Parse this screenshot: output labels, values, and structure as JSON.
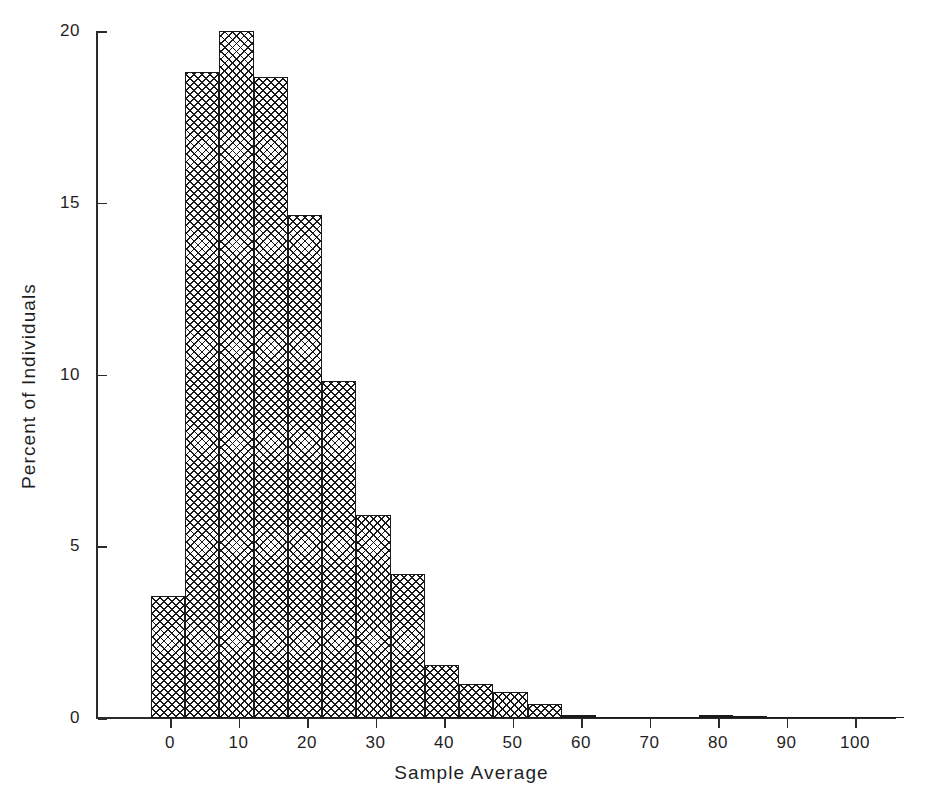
{
  "chart_data": {
    "type": "bar",
    "title": "",
    "subtitle": "",
    "xlabel": "Sample Average",
    "ylabel": "Percent of Individuals",
    "xlim": [
      -7,
      110
    ],
    "ylim": [
      0,
      20
    ],
    "grid": false,
    "legend": null,
    "bin_width": 5,
    "bin_starts": [
      -2.8,
      2.2,
      7.2,
      12.2,
      17.2,
      22.2,
      27.2,
      32.2,
      37.2,
      42.2,
      47.2,
      52.2,
      57.2,
      62.2,
      67.2,
      72.2,
      77.2,
      82.2,
      87.2,
      92.2,
      97.2,
      102.2
    ],
    "bin_centers": [
      -0.3,
      4.7,
      9.7,
      14.7,
      19.7,
      24.7,
      29.7,
      34.7,
      39.7,
      44.7,
      49.7,
      54.7,
      59.7,
      64.7,
      69.7,
      74.7,
      79.7,
      84.7,
      89.7,
      94.7,
      99.7,
      104.7
    ],
    "values": [
      3.55,
      18.8,
      20.0,
      18.65,
      14.65,
      9.8,
      5.9,
      4.2,
      1.55,
      1.0,
      0.75,
      0.4,
      0.1,
      0.03,
      0.02,
      0.02,
      0.08,
      0.05,
      0.02,
      0.0,
      0.0,
      0.0
    ],
    "xticks": [
      0,
      10,
      20,
      30,
      40,
      50,
      60,
      70,
      80,
      90,
      100
    ],
    "xticklabels": [
      "0",
      "10",
      "20",
      "30",
      "40",
      "50",
      "60",
      "70",
      "80",
      "90",
      "100"
    ],
    "yticks": [
      0,
      5,
      10,
      15,
      20
    ],
    "yticklabels": [
      "0",
      "5",
      "10",
      "15",
      "20"
    ],
    "bar_style": "crosshatch",
    "bar_color": "#1a1a1a",
    "background_color": "#ffffff"
  }
}
